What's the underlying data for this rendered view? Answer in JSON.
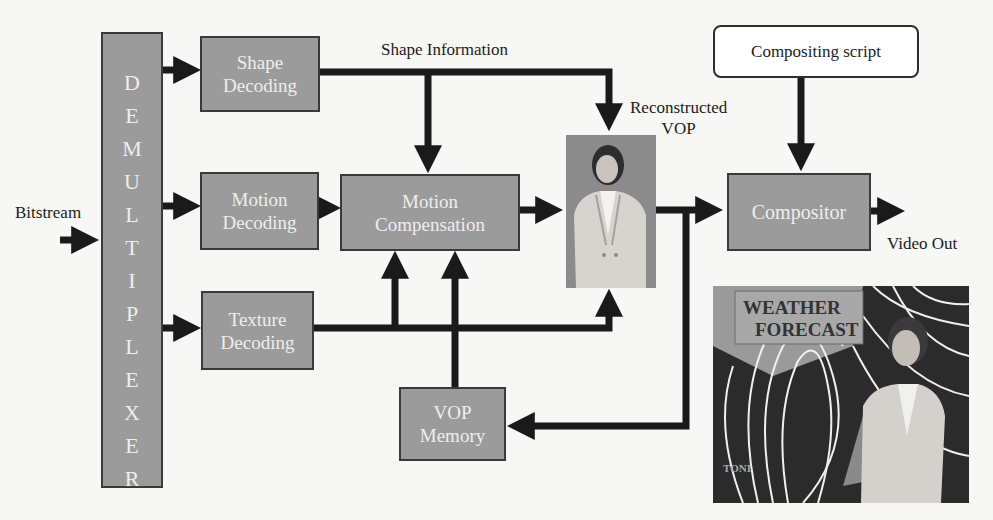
{
  "diagram": {
    "input_label": "Bitstream",
    "demultiplexer": {
      "label": "DEMULTIPLEXER",
      "letters": [
        "D",
        "E",
        "M",
        "U",
        "L",
        "T",
        "I",
        "P",
        "L",
        "E",
        "X",
        "E",
        "R"
      ]
    },
    "blocks": {
      "shape_decoding": "Shape\nDecoding",
      "motion_decoding": "Motion\nDecoding",
      "texture_decoding": "Texture\nDecoding",
      "motion_compensation": "Motion\nCompensation",
      "vop_memory": "VOP\nMemory",
      "compositor": "Compositor",
      "compositing_script": "Compositing script"
    },
    "labels": {
      "shape_information": "Shape Information",
      "reconstructed_vop": "Reconstructed\nVOP",
      "video_out": "Video Out"
    },
    "images": {
      "reconstructed_vop_image": "presenter-figure-icon",
      "output_frame_image": "weather-forecast-frame-icon",
      "output_frame_caption_1": "WEATHER",
      "output_frame_caption_2": "FORECAST",
      "output_frame_corner_text": "TONI"
    },
    "colors": {
      "block_fill": "#9b9b9b",
      "block_border": "#3a3a3a",
      "block_text": "#eeeeee",
      "arrow": "#1a1a1a",
      "background": "#f7f7f5"
    }
  }
}
